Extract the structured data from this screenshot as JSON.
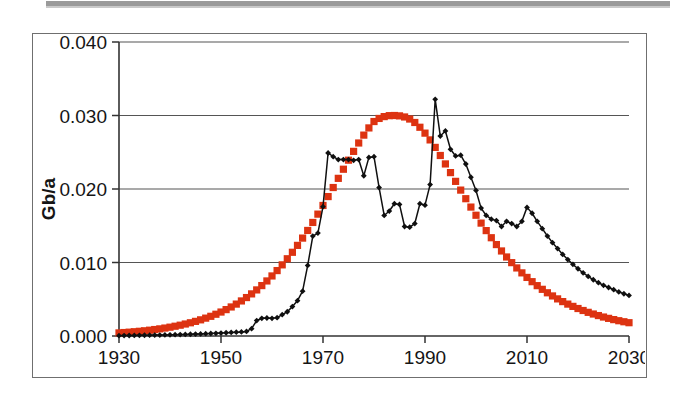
{
  "figure": {
    "caption": "",
    "frame_border_color": "#6f6f6f",
    "background_color": "#ffffff"
  },
  "chart_data": {
    "type": "line",
    "title": "",
    "xlabel": "",
    "ylabel": "Gb/a",
    "xlim": [
      1930,
      2030
    ],
    "ylim": [
      0.0,
      0.04
    ],
    "xticks": [
      1930,
      1950,
      1970,
      1990,
      2010,
      2030
    ],
    "xtick_labels": [
      "1930",
      "1950",
      "1970",
      "1990",
      "2010",
      "2030"
    ],
    "yticks": [
      0.0,
      0.01,
      0.02,
      0.03,
      0.04
    ],
    "ytick_labels": [
      "0.000",
      "0.010",
      "0.020",
      "0.030",
      "0.040"
    ],
    "grid": "horizontal",
    "legend": "none",
    "series": [
      {
        "name": "model-curve",
        "style": "thick-square-markers",
        "color": "#DD3311",
        "marker": "square",
        "x": [
          1930,
          1931,
          1932,
          1933,
          1934,
          1935,
          1936,
          1937,
          1938,
          1939,
          1940,
          1941,
          1942,
          1943,
          1944,
          1945,
          1946,
          1947,
          1948,
          1949,
          1950,
          1951,
          1952,
          1953,
          1954,
          1955,
          1956,
          1957,
          1958,
          1959,
          1960,
          1961,
          1962,
          1963,
          1964,
          1965,
          1966,
          1967,
          1968,
          1969,
          1970,
          1971,
          1972,
          1973,
          1974,
          1975,
          1976,
          1977,
          1978,
          1979,
          1980,
          1981,
          1982,
          1983,
          1984,
          1985,
          1986,
          1987,
          1988,
          1989,
          1990,
          1991,
          1992,
          1993,
          1994,
          1995,
          1996,
          1997,
          1998,
          1999,
          2000,
          2001,
          2002,
          2003,
          2004,
          2005,
          2006,
          2007,
          2008,
          2009,
          2010,
          2011,
          2012,
          2013,
          2014,
          2015,
          2016,
          2017,
          2018,
          2019,
          2020,
          2021,
          2022,
          2023,
          2024,
          2025,
          2026,
          2027,
          2028,
          2029,
          2030
        ],
        "y": [
          0.00042,
          0.00047,
          0.00052,
          0.00058,
          0.00064,
          0.00071,
          0.00079,
          0.00088,
          0.00097,
          0.00108,
          0.0012,
          0.00133,
          0.00147,
          0.00163,
          0.0018,
          0.00199,
          0.0022,
          0.00243,
          0.00268,
          0.00296,
          0.00326,
          0.00359,
          0.00395,
          0.00434,
          0.00477,
          0.00523,
          0.00573,
          0.00627,
          0.00686,
          0.00749,
          0.00817,
          0.0089,
          0.00968,
          0.01051,
          0.01139,
          0.01233,
          0.01332,
          0.01436,
          0.01545,
          0.01658,
          0.01776,
          0.01897,
          0.0202,
          0.02145,
          0.02269,
          0.02392,
          0.02512,
          0.02626,
          0.02733,
          0.02831,
          0.02918,
          0.0296,
          0.02985,
          0.02998,
          0.03,
          0.02995,
          0.0298,
          0.02952,
          0.02905,
          0.0284,
          0.0276,
          0.02668,
          0.02566,
          0.02456,
          0.02341,
          0.02223,
          0.02104,
          0.01985,
          0.01868,
          0.01754,
          0.01643,
          0.01536,
          0.01434,
          0.01337,
          0.01244,
          0.01157,
          0.01075,
          0.00998,
          0.00926,
          0.00859,
          0.00797,
          0.00739,
          0.00685,
          0.00635,
          0.00588,
          0.00545,
          0.00505,
          0.00468,
          0.00434,
          0.00403,
          0.00374,
          0.00347,
          0.00322,
          0.00299,
          0.00278,
          0.00258,
          0.0024,
          0.00223,
          0.00208,
          0.00194,
          0.00181
        ]
      },
      {
        "name": "historical-data",
        "style": "thin-line-diamond-markers",
        "color": "#101010",
        "marker": "diamond",
        "x": [
          1930,
          1931,
          1932,
          1933,
          1934,
          1935,
          1936,
          1937,
          1938,
          1939,
          1940,
          1941,
          1942,
          1943,
          1944,
          1945,
          1946,
          1947,
          1948,
          1949,
          1950,
          1951,
          1952,
          1953,
          1954,
          1955,
          1956,
          1957,
          1958,
          1959,
          1960,
          1961,
          1962,
          1963,
          1964,
          1965,
          1966,
          1967,
          1968,
          1969,
          1970,
          1971,
          1972,
          1973,
          1974,
          1975,
          1976,
          1977,
          1978,
          1979,
          1980,
          1981,
          1982,
          1983,
          1984,
          1985,
          1986,
          1987,
          1988,
          1989,
          1990,
          1991,
          1992,
          1993,
          1994,
          1995,
          1996,
          1997,
          1998,
          1999,
          2000,
          2001,
          2002,
          2003,
          2004,
          2005,
          2006,
          2007,
          2008,
          2009,
          2010,
          2011,
          2012,
          2013,
          2014,
          2015,
          2016,
          2017,
          2018,
          2019,
          2020,
          2021,
          2022,
          2023,
          2024,
          2025,
          2026,
          2027,
          2028,
          2029,
          2030
        ],
        "y": [
          5e-05,
          6e-05,
          7e-05,
          8e-05,
          9e-05,
          0.0001,
          0.00011,
          0.00012,
          0.00013,
          0.00014,
          0.00016,
          0.00018,
          0.0002,
          0.00022,
          0.00024,
          0.00026,
          0.00028,
          0.00031,
          0.00034,
          0.00037,
          0.0004,
          0.00044,
          0.00048,
          0.00052,
          0.00056,
          0.00062,
          0.001,
          0.0021,
          0.0024,
          0.00245,
          0.0024,
          0.0025,
          0.0029,
          0.0033,
          0.004,
          0.0048,
          0.0061,
          0.0096,
          0.0136,
          0.014,
          0.0176,
          0.0249,
          0.0244,
          0.024,
          0.024,
          0.024,
          0.0239,
          0.024,
          0.0218,
          0.0243,
          0.0244,
          0.0202,
          0.0164,
          0.017,
          0.018,
          0.0179,
          0.0149,
          0.0148,
          0.0153,
          0.018,
          0.0178,
          0.0206,
          0.0322,
          0.0272,
          0.0279,
          0.0254,
          0.0245,
          0.0246,
          0.0234,
          0.0216,
          0.0198,
          0.0174,
          0.0164,
          0.0159,
          0.0157,
          0.0149,
          0.0156,
          0.0153,
          0.0149,
          0.0156,
          0.0175,
          0.0167,
          0.0156,
          0.0146,
          0.0136,
          0.0127,
          0.0119,
          0.0111,
          0.0104,
          0.00975,
          0.00915,
          0.0086,
          0.0081,
          0.00765,
          0.00725,
          0.0069,
          0.0066,
          0.0063,
          0.006,
          0.00575,
          0.00552
        ]
      }
    ]
  }
}
